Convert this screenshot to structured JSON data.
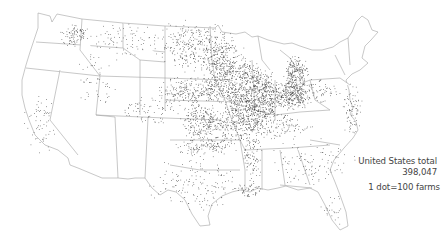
{
  "map": {
    "title": "Farms by dot density",
    "legend": {
      "region_label": "United States total",
      "total": "398,047",
      "scale": "1 dot=100 farms"
    },
    "colors": {
      "dot": "#3a3a3a",
      "border": "#9a9a9a",
      "background": "#ffffff"
    },
    "density_regions": [
      {
        "name": "ohio-indiana-core",
        "cx": 262,
        "cy": 98,
        "rx": 16,
        "ry": 22,
        "n": 520
      },
      {
        "name": "ohio-east",
        "cx": 292,
        "cy": 95,
        "rx": 14,
        "ry": 12,
        "n": 320
      },
      {
        "name": "michigan-south",
        "cx": 296,
        "cy": 72,
        "rx": 10,
        "ry": 12,
        "n": 180
      },
      {
        "name": "iowa-core",
        "cx": 226,
        "cy": 82,
        "rx": 22,
        "ry": 20,
        "n": 360
      },
      {
        "name": "illinois-west",
        "cx": 240,
        "cy": 105,
        "rx": 12,
        "ry": 18,
        "n": 220
      },
      {
        "name": "kansas-east",
        "cx": 200,
        "cy": 120,
        "rx": 18,
        "ry": 14,
        "n": 220
      },
      {
        "name": "dakotas",
        "cx": 195,
        "cy": 45,
        "rx": 32,
        "ry": 20,
        "n": 330
      },
      {
        "name": "nebraska",
        "cx": 190,
        "cy": 90,
        "rx": 28,
        "ry": 12,
        "n": 220
      },
      {
        "name": "minnesota-south",
        "cx": 225,
        "cy": 58,
        "rx": 18,
        "ry": 14,
        "n": 170
      },
      {
        "name": "missouri",
        "cx": 235,
        "cy": 125,
        "rx": 22,
        "ry": 14,
        "n": 190
      },
      {
        "name": "oklahoma",
        "cx": 205,
        "cy": 145,
        "rx": 24,
        "ry": 10,
        "n": 150
      },
      {
        "name": "kentucky-tn",
        "cx": 275,
        "cy": 125,
        "rx": 30,
        "ry": 10,
        "n": 130
      },
      {
        "name": "texas",
        "cx": 195,
        "cy": 185,
        "rx": 36,
        "ry": 24,
        "n": 150
      },
      {
        "name": "mississippi-delta",
        "cx": 252,
        "cy": 150,
        "rx": 8,
        "ry": 28,
        "n": 120
      },
      {
        "name": "wisconsin-south",
        "cx": 250,
        "cy": 72,
        "rx": 12,
        "ry": 10,
        "n": 90
      },
      {
        "name": "pennsylvania",
        "cx": 320,
        "cy": 90,
        "rx": 18,
        "ry": 10,
        "n": 70
      },
      {
        "name": "mid-atlantic",
        "cx": 352,
        "cy": 110,
        "rx": 8,
        "ry": 22,
        "n": 80
      },
      {
        "name": "southeast",
        "cx": 310,
        "cy": 160,
        "rx": 35,
        "ry": 20,
        "n": 110
      },
      {
        "name": "montana",
        "cx": 125,
        "cy": 40,
        "rx": 28,
        "ry": 16,
        "n": 80
      },
      {
        "name": "washington-east",
        "cx": 75,
        "cy": 35,
        "rx": 12,
        "ry": 10,
        "n": 90
      },
      {
        "name": "california",
        "cx": 40,
        "cy": 125,
        "rx": 14,
        "ry": 26,
        "n": 60
      },
      {
        "name": "idaho-utah",
        "cx": 95,
        "cy": 80,
        "rx": 16,
        "ry": 24,
        "n": 50
      },
      {
        "name": "colorado",
        "cx": 150,
        "cy": 110,
        "rx": 22,
        "ry": 14,
        "n": 70
      },
      {
        "name": "louisiana",
        "cx": 250,
        "cy": 190,
        "rx": 12,
        "ry": 6,
        "n": 50
      },
      {
        "name": "florida",
        "cx": 330,
        "cy": 210,
        "rx": 10,
        "ry": 16,
        "n": 25
      }
    ]
  }
}
